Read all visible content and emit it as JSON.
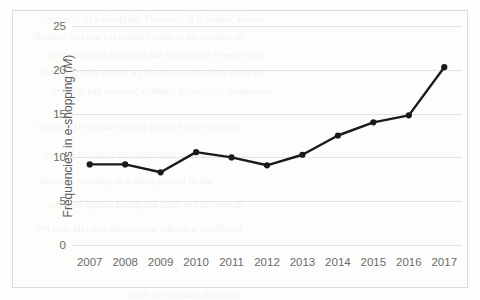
{
  "chart_data": {
    "type": "line",
    "title": "",
    "xlabel": "",
    "ylabel": "Frequencies in e-shopping (M)",
    "ylabel_prefix": "Frequencies in e-shopping (",
    "ylabel_italic": "M",
    "ylabel_suffix": ")",
    "categories": [
      "2007",
      "2008",
      "2009",
      "2010",
      "2011",
      "2012",
      "2013",
      "2014",
      "2015",
      "2016",
      "2017"
    ],
    "values": [
      9.2,
      9.2,
      8.3,
      10.6,
      10.0,
      9.1,
      10.3,
      12.5,
      14.0,
      14.8,
      20.3
    ],
    "series": [
      {
        "name": "Frequencies in e-shopping (M)",
        "values": [
          9.2,
          9.2,
          8.3,
          10.6,
          10.0,
          9.1,
          10.3,
          12.5,
          14.0,
          14.8,
          20.3
        ]
      }
    ],
    "ylim": [
      0,
      25
    ],
    "yticks": [
      0,
      5,
      10,
      15,
      20,
      25
    ],
    "ytick_labels": [
      "0",
      "5",
      "10",
      "15",
      "20",
      "25"
    ],
    "grid": true,
    "grid_axis": "y",
    "legend": "none",
    "marker": "circle",
    "line_color": "#1a1a1a",
    "marker_color": "#1a1a1a",
    "grid_color": "#e3e3e3",
    "tick_text_color": "#6b6b6b",
    "axis_label_color": "#5d5d5d",
    "border_color": "#dcdcdc",
    "background_color": "#fdfdfc"
  },
  "background_bleed": [
    "nwonk ylediw si ti ,revewoH .gnippohs-e fo ycneuqerf",
    "ni esaercni na ot sdael ytilibaliava tenretni redaorB",
    "sraey tnecer ni denilced sah gnippohs lanoitidart taht",
    "tnemyap enilno fo htworg eht yb nevird ylegral si dnert",
    "sremusnoc ,2102 retfA .smetsys yreviled dna smetsys",
    "esahcrup rieht fo erom gnitfihs nageb ylgnisaercni",
    "elibom no ylralucitrap ,slennahc enilno ot ytivitca",
    "eht ni htworg prahs a ni gnitluser ,secived",
    "doirep 7102 ot 3102 eht gnirud serugif detroper",
    "tnacifingis a stcelfer noitavresbo siht taht eton eW",
    "roivaheb remusnoc ni tfihs"
  ]
}
